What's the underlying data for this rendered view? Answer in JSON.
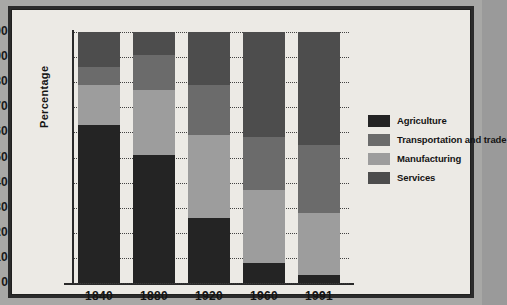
{
  "chart_data": {
    "type": "bar",
    "subtype": "stacked-bar-100-percent",
    "title": "",
    "xlabel": "",
    "ylabel": "Percentage",
    "ylim": [
      0,
      100
    ],
    "ytick_step": 10,
    "yticks": [
      "100",
      "90",
      "80",
      "70",
      "60",
      "50",
      "40",
      "30",
      "20",
      "10",
      "0"
    ],
    "grid": "horizontal-dotted",
    "legend_position": "right",
    "categories": [
      "1840",
      "1880",
      "1920",
      "1960",
      "1991"
    ],
    "series": [
      {
        "name": "Agriculture",
        "color": "#242424",
        "values": [
          63,
          51,
          26,
          8,
          3
        ]
      },
      {
        "name": "Manufacturing",
        "color": "#9d9d9d",
        "values": [
          16,
          26,
          33,
          29,
          25
        ]
      },
      {
        "name": "Transportation and trade",
        "color": "#6b6b6b",
        "values": [
          7,
          14,
          20,
          21,
          27
        ]
      },
      {
        "name": "Services",
        "color": "#4d4d4d",
        "values": [
          14,
          9,
          21,
          42,
          45
        ]
      }
    ],
    "stack_order_bottom_to_top": [
      "Agriculture",
      "Manufacturing",
      "Transportation and trade",
      "Services"
    ],
    "cumulative_tops": {
      "1840": {
        "Agriculture": 63,
        "Manufacturing": 79,
        "Transportation and trade": 86,
        "Services": 100
      },
      "1880": {
        "Agriculture": 51,
        "Manufacturing": 77,
        "Transportation and trade": 91,
        "Services": 100
      },
      "1920": {
        "Agriculture": 26,
        "Manufacturing": 59,
        "Transportation and trade": 79,
        "Services": 100
      },
      "1960": {
        "Agriculture": 8,
        "Manufacturing": 37,
        "Transportation and trade": 58,
        "Services": 100
      },
      "1991": {
        "Agriculture": 3,
        "Manufacturing": 28,
        "Transportation and trade": 55,
        "Services": 100
      }
    }
  },
  "legend": {
    "items": [
      {
        "label": "Agriculture",
        "color": "#242424"
      },
      {
        "label": "Transportation and trade",
        "color": "#6b6b6b"
      },
      {
        "label": "Manufacturing",
        "color": "#9d9d9d"
      },
      {
        "label": "Services",
        "color": "#4d4d4d"
      }
    ]
  },
  "colors": {
    "page_background": "#a8a8a6",
    "panel_background": "#eceae5",
    "frame": "#2b2b2b",
    "axis": "#2a2a2a",
    "text": "#141414"
  }
}
